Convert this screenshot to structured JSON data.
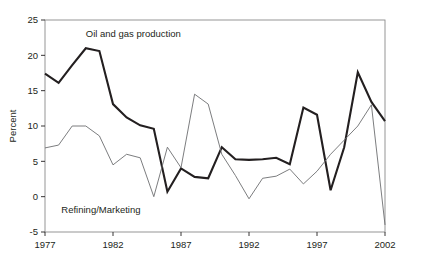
{
  "chart_data": {
    "type": "line",
    "title": "",
    "xlabel": "",
    "ylabel": "Percent",
    "xlim": [
      1977,
      2002
    ],
    "ylim": [
      -5,
      25
    ],
    "ytick_values": [
      -5,
      0,
      5,
      10,
      15,
      20,
      25
    ],
    "ytick_labels": [
      "-5",
      "0",
      "5",
      "10",
      "15",
      "20",
      "25"
    ],
    "xtick_values": [
      1977,
      1982,
      1987,
      1992,
      1997,
      2002
    ],
    "xtick_labels": [
      "1977",
      "1982",
      "1987",
      "1992",
      "1997",
      "2002"
    ],
    "grid": false,
    "legend_position": "inline-annotations",
    "x": [
      1977,
      1978,
      1979,
      1980,
      1981,
      1982,
      1983,
      1984,
      1985,
      1986,
      1987,
      1988,
      1989,
      1990,
      1991,
      1992,
      1993,
      1994,
      1995,
      1996,
      1997,
      1998,
      1999,
      2000,
      2001,
      2002
    ],
    "series": [
      {
        "name": "Oil and gas production",
        "color": "#231f20",
        "line_width": 2.1,
        "label_x": 1980.0,
        "label_y": 22.6,
        "values": [
          17.4,
          16.1,
          18.6,
          21.0,
          20.6,
          13.1,
          11.2,
          10.1,
          9.6,
          0.7,
          4.0,
          2.8,
          2.6,
          7.0,
          5.3,
          5.2,
          5.3,
          5.5,
          4.6,
          12.6,
          11.6,
          0.9,
          7.0,
          17.6,
          13.4,
          10.7
        ]
      },
      {
        "name": "Refining/Marketing",
        "color": "#6d6e71",
        "line_width": 0.9,
        "label_x": 1978.2,
        "label_y": -2.3,
        "values": [
          6.9,
          7.3,
          10.0,
          10.0,
          8.6,
          4.5,
          6.0,
          5.5,
          0.0,
          7.0,
          4.1,
          14.5,
          13.1,
          6.0,
          3.0,
          -0.3,
          2.6,
          2.9,
          3.9,
          1.8,
          3.6,
          6.0,
          8.0,
          10.0,
          13.0,
          -4.0
        ]
      }
    ]
  },
  "axis": {
    "y_title": "Percent"
  }
}
